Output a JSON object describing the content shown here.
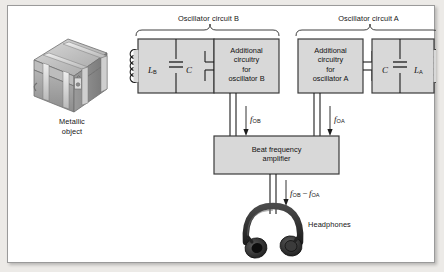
{
  "figure": {
    "kind": "metal-detector-block-diagram",
    "background": "#ffffff",
    "frame_color": "#9a9a9a",
    "box_fill": "#d8d8d8",
    "box_stroke": "#3b3b3b",
    "line_color": "#1c1c1c"
  },
  "object": {
    "label_line1": "Metallic",
    "label_line2": "object",
    "body_color": "#a9a9a9",
    "band_color": "#d7d7d7"
  },
  "oscillator_b": {
    "bracket_label": "Oscillator circuit B",
    "inductor_symbol": "L",
    "inductor_subscript": "B",
    "capacitor_symbol": "C",
    "circuitry_box": {
      "line1": "Additional",
      "line2": "circuitry",
      "line3": "for",
      "line4": "oscillator B"
    },
    "output_label_symbol": "f",
    "output_label_subscript": "OB"
  },
  "oscillator_a": {
    "bracket_label": "Oscillator circuit A",
    "inductor_symbol": "L",
    "inductor_subscript": "A",
    "capacitor_symbol": "C",
    "circuitry_box": {
      "line1": "Additional",
      "line2": "circuitry",
      "line3": "for",
      "line4": "oscillator A"
    },
    "output_label_symbol": "f",
    "output_label_subscript": "OA"
  },
  "amplifier": {
    "line1": "Beat frequency",
    "line2": "amplifier",
    "output_symbol_1": "f",
    "output_subscript_1": "OB",
    "output_operator": "−",
    "output_symbol_2": "f",
    "output_subscript_2": "OA"
  },
  "headphones": {
    "label": "Headphones",
    "color": "#2b2b2b"
  }
}
